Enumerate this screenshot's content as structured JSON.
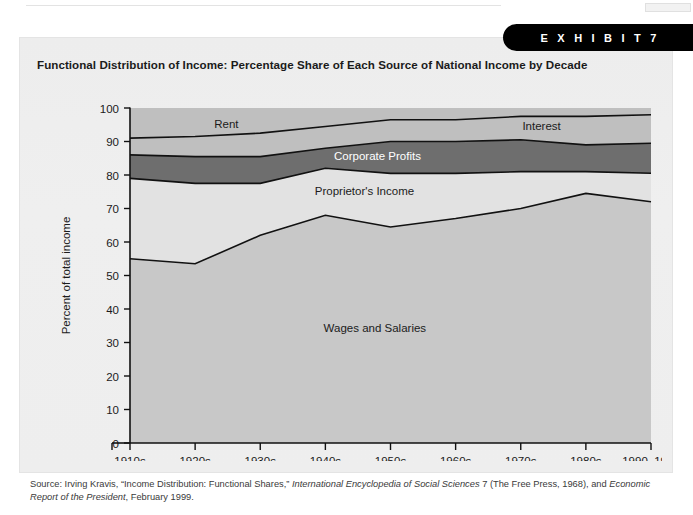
{
  "exhibit": {
    "banner_label": "E X H I B I T   7",
    "title": "Functional Distribution of Income: Percentage Share of Each Source of National Income by Decade"
  },
  "source": {
    "prefix": "Source: Irving Kravis, “Income Distribution: Functional Shares,” ",
    "italic_1": "International Encyclopedia of Social Sciences",
    "middle": " 7 (The Free Press, 1968), and ",
    "italic_2": "Economic Report of the President",
    "suffix": ", February 1999."
  },
  "colors": {
    "page_background": "#ffffff",
    "card_background": "#eeeeee",
    "banner": "#000000",
    "wages": "#c8c8c8",
    "proprietors": "#e2e2e2",
    "corporate_profits": "#6e6e6e",
    "rent": "#bfbfbf",
    "interest": "#bfbfbf",
    "axis": "#111111",
    "series_line": "#111111",
    "plot_top_band": "#d8d8d8"
  },
  "chart_data": {
    "type": "area",
    "stacked": true,
    "title": "Functional Distribution of Income: Percentage Share of Each Source of National Income by Decade",
    "xlabel": "",
    "ylabel": "Percent of total income",
    "ylim": [
      0,
      100
    ],
    "ytick_step": 10,
    "yticks": [
      0,
      10,
      20,
      30,
      40,
      50,
      60,
      70,
      80,
      90,
      100
    ],
    "grid": false,
    "legend": "in-plot-labels",
    "categories": [
      "1910s",
      "1920s",
      "1930s",
      "1940s",
      "1950s",
      "1960s",
      "1970s",
      "1980s",
      "1990–1998"
    ],
    "series": [
      {
        "name": "Wages and Salaries",
        "values": [
          55.0,
          53.5,
          62.0,
          68.0,
          64.5,
          67.0,
          70.0,
          74.5,
          72.0
        ]
      },
      {
        "name": "Proprietor's Income",
        "values": [
          24.0,
          24.0,
          15.5,
          14.0,
          16.0,
          13.5,
          11.0,
          6.5,
          8.5
        ]
      },
      {
        "name": "Corporate Profits",
        "values": [
          7.0,
          8.0,
          8.0,
          6.0,
          9.5,
          9.5,
          9.5,
          8.0,
          9.0
        ]
      },
      {
        "name": "Rent",
        "values": [
          5.0,
          6.0,
          7.0,
          6.5,
          6.5,
          6.5,
          7.0,
          8.5,
          8.5
        ]
      },
      {
        "name": "Interest",
        "values": [
          9.0,
          8.5,
          7.5,
          5.5,
          3.5,
          3.5,
          2.5,
          2.5,
          2.0
        ]
      }
    ],
    "cumulative_boundaries": {
      "wages_top": [
        55.0,
        53.5,
        62.0,
        68.0,
        64.5,
        67.0,
        70.0,
        74.5,
        72.0
      ],
      "proprietors_top": [
        79.0,
        77.5,
        77.5,
        82.0,
        80.5,
        80.5,
        81.0,
        81.0,
        80.5
      ],
      "corporate_profits_top": [
        86.0,
        85.5,
        85.5,
        88.0,
        90.0,
        90.0,
        90.5,
        89.0,
        89.5
      ],
      "rent_top": [
        91.0,
        91.5,
        92.5,
        94.5,
        96.5,
        96.5,
        97.5,
        97.5,
        98.0
      ],
      "interest_top": [
        100.0,
        100.0,
        100.0,
        100.0,
        100.0,
        100.0,
        100.0,
        100.0,
        100.0
      ]
    },
    "inplot_labels": [
      {
        "key": "rent",
        "text": "Rent",
        "x_pct": 18.5,
        "y_value": 94.0
      },
      {
        "key": "interest",
        "text": "Interest",
        "x_pct": 79.0,
        "y_value": 93.5
      },
      {
        "key": "corporate",
        "text": "Corporate Profits",
        "x_pct": 47.5,
        "y_value": 84.5
      },
      {
        "key": "proprietor",
        "text": "Proprietor's Income",
        "x_pct": 45.0,
        "y_value": 74.0
      },
      {
        "key": "wages",
        "text": "Wages and Salaries",
        "x_pct": 47.0,
        "y_value": 33.0
      }
    ]
  }
}
